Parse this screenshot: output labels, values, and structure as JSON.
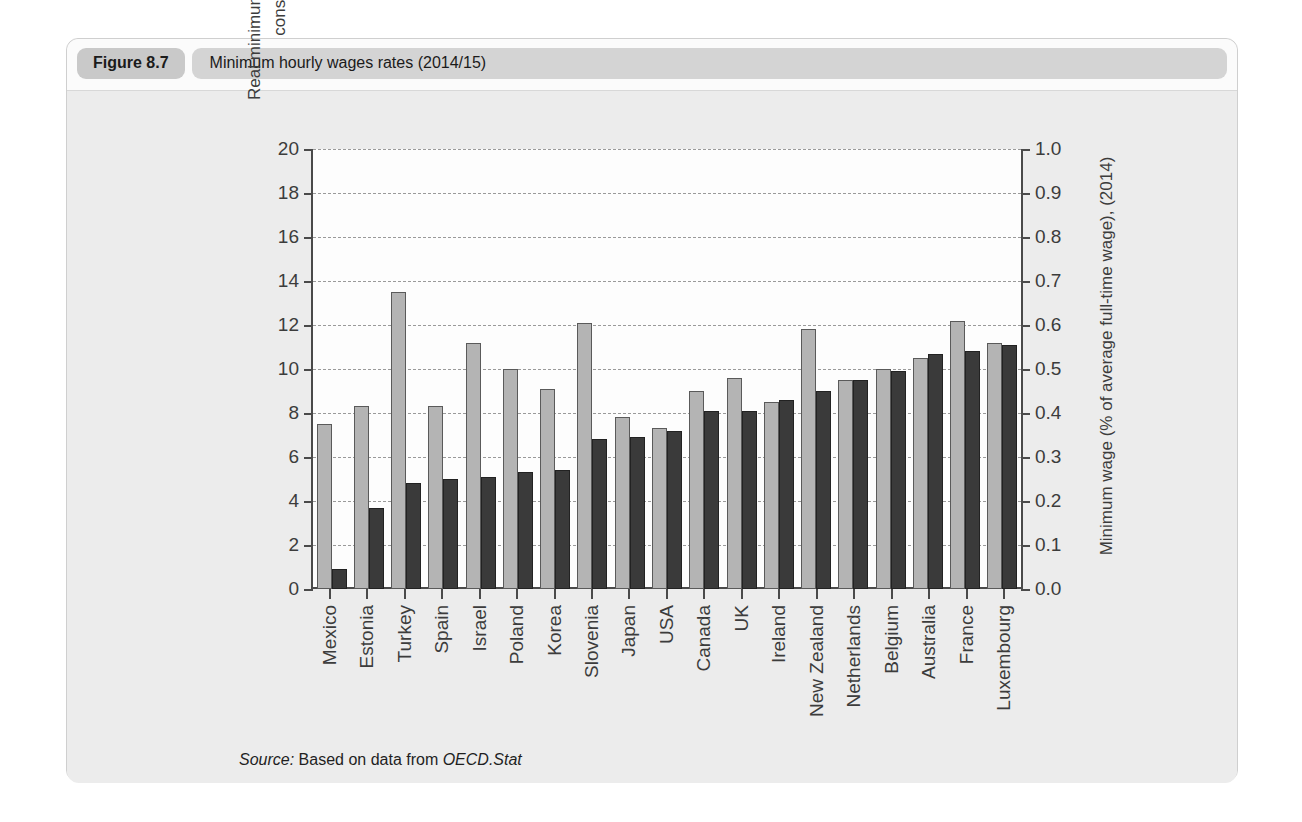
{
  "figure": {
    "tag": "Figure 8.7",
    "title": "Minimum hourly wages rates (2014/15)",
    "source_prefix": "Source:",
    "source_middle": " Based on data from ",
    "source_italic": "OECD.Stat"
  },
  "colors": {
    "light_bar": "#b4b4b4",
    "dark_bar": "#3a3a3a",
    "axis": "#4a4a4a",
    "grid": "#9a9a9a",
    "panel": "#ececec",
    "tag_bg": "#c9c9c9",
    "title_bg": "#d4d4d4"
  },
  "chart_data": {
    "type": "bar",
    "title": "Minimum hourly wages rates (2014/15)",
    "xlabel": "",
    "ylabel": "Real minimum wage rates ($ per hour at 2014 constant prices, PPP) (2015)",
    "y2label": "Minimum wage (% of average full-time wage), (2014)",
    "ylim": [
      0,
      20
    ],
    "y2lim": [
      0,
      1.0
    ],
    "yticks": [
      "0",
      "2",
      "4",
      "6",
      "8",
      "10",
      "12",
      "14",
      "16",
      "18",
      "20"
    ],
    "y2ticks": [
      "0.0",
      "0.1",
      "0.2",
      "0.3",
      "0.4",
      "0.5",
      "0.6",
      "0.7",
      "0.8",
      "0.9",
      "1.0"
    ],
    "grid": true,
    "legend_position": "none",
    "categories": [
      "Mexico",
      "Estonia",
      "Turkey",
      "Spain",
      "Israel",
      "Poland",
      "Korea",
      "Slovenia",
      "Japan",
      "USA",
      "Canada",
      "UK",
      "Ireland",
      "New Zealand",
      "Netherlands",
      "Belgium",
      "Australia",
      "France",
      "Luxembourg"
    ],
    "series": [
      {
        "name": "Real minimum wage rates ($ per hour at 2014 constant prices, PPP) (2015)",
        "axis": "left",
        "color": "#b4b4b4",
        "values": [
          7.5,
          8.3,
          13.5,
          8.3,
          11.2,
          10.0,
          9.1,
          12.1,
          7.8,
          7.3,
          9.0,
          9.6,
          8.5,
          11.8,
          9.5,
          10.0,
          10.5,
          12.2,
          11.2
        ]
      },
      {
        "name": "Minimum wage (% of average full-time wage), (2014)",
        "axis": "right",
        "color": "#3a3a3a",
        "values_left_scale": [
          0.9,
          3.7,
          4.8,
          5.0,
          5.1,
          5.3,
          5.4,
          6.8,
          6.9,
          7.2,
          8.1,
          8.1,
          8.6,
          9.0,
          9.5,
          9.9,
          10.7,
          10.8,
          11.1
        ],
        "values": [
          0.045,
          0.185,
          0.24,
          0.25,
          0.255,
          0.265,
          0.27,
          0.34,
          0.345,
          0.36,
          0.405,
          0.405,
          0.43,
          0.45,
          0.475,
          0.495,
          0.535,
          0.54,
          0.555
        ]
      }
    ]
  }
}
